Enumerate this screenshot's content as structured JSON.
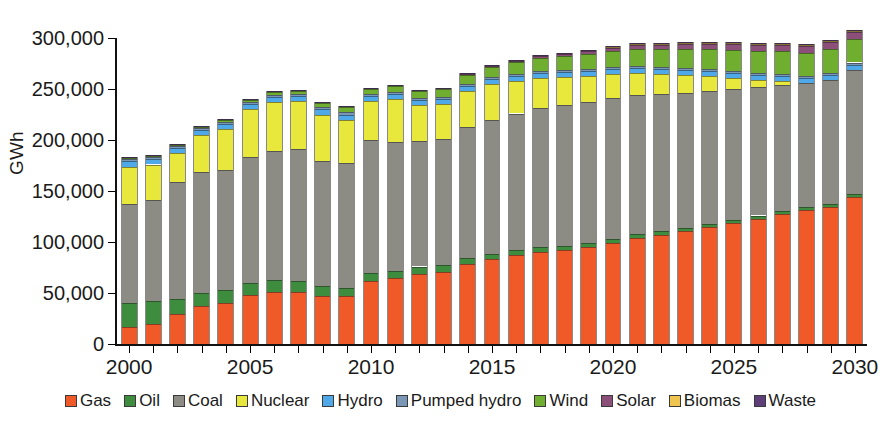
{
  "chart_data": {
    "type": "bar",
    "stacked": true,
    "title": "",
    "subtitle": "",
    "xlabel": "",
    "ylabel": "GWh",
    "ylim": [
      0,
      300000
    ],
    "ytick_values": [
      0,
      50000,
      100000,
      150000,
      200000,
      250000,
      300000
    ],
    "ytick_labels": [
      "0",
      "50,000",
      "100,000",
      "150,000",
      "200,000",
      "250,000",
      "300,000"
    ],
    "xtick_labels": [
      "2000",
      "2005",
      "2010",
      "2015",
      "2020",
      "2025",
      "2030"
    ],
    "grid": false,
    "legend_position": "bottom",
    "categories": [
      "2000",
      "2001",
      "2002",
      "2003",
      "2004",
      "2005",
      "2006",
      "2007",
      "2008",
      "2009",
      "2010",
      "2011",
      "2012",
      "2013",
      "2014",
      "2015",
      "2016",
      "2017",
      "2018",
      "2019",
      "2020",
      "2021",
      "2022",
      "2023",
      "2024",
      "2025",
      "2026",
      "2027",
      "2028",
      "2029",
      "2030"
    ],
    "series": [
      {
        "name": "Gas",
        "color": "#F05A28",
        "values": [
          17000,
          20000,
          29000,
          37000,
          40000,
          48000,
          51000,
          51000,
          47000,
          47000,
          62000,
          65000,
          69000,
          71000,
          78000,
          83000,
          87000,
          90000,
          92000,
          95000,
          99000,
          104000,
          107000,
          111000,
          115000,
          119000,
          123000,
          127000,
          131000,
          134000,
          144000
        ]
      },
      {
        "name": "Oil",
        "color": "#3E8C3E",
        "values": [
          23000,
          22000,
          15000,
          13000,
          13000,
          12000,
          12000,
          11000,
          10000,
          8000,
          8000,
          7000,
          7000,
          6000,
          6000,
          5000,
          5000,
          5000,
          4000,
          4000,
          4000,
          4000,
          4000,
          3000,
          3000,
          3000,
          3000,
          3000,
          3000,
          3000,
          3000
        ]
      },
      {
        "name": "Coal",
        "color": "#8C8C84",
        "values": [
          97000,
          99000,
          115000,
          119000,
          118000,
          123000,
          126000,
          129000,
          122000,
          122000,
          130000,
          126000,
          123000,
          124000,
          129000,
          132000,
          134000,
          136000,
          138000,
          138000,
          138000,
          136000,
          134000,
          132000,
          130000,
          128000,
          126000,
          124000,
          122000,
          122000,
          122000
        ]
      },
      {
        "name": "Nuclear",
        "color": "#E8E83C",
        "values": [
          37000,
          35000,
          28000,
          36000,
          40000,
          47000,
          48000,
          47000,
          46000,
          43000,
          38000,
          42000,
          35000,
          34000,
          35000,
          35000,
          32000,
          30000,
          28000,
          26000,
          24000,
          22000,
          20000,
          18000,
          15000,
          11000,
          7000,
          4000,
          0,
          0,
          0
        ]
      },
      {
        "name": "Hydro",
        "color": "#4FA8E8",
        "values": [
          5000,
          5000,
          5000,
          5000,
          5000,
          5000,
          5000,
          5000,
          5000,
          5000,
          5000,
          5000,
          5000,
          5000,
          5000,
          5000,
          5000,
          5000,
          5000,
          5000,
          5000,
          5000,
          5000,
          5000,
          5000,
          5000,
          5000,
          5000,
          5000,
          5000,
          5000
        ]
      },
      {
        "name": "Pumped hydro",
        "color": "#7A97B5",
        "values": [
          2000,
          2000,
          2000,
          2000,
          2000,
          2000,
          2000,
          2000,
          2000,
          2000,
          2000,
          2000,
          2000,
          2000,
          2000,
          2000,
          2000,
          2000,
          2000,
          2000,
          2000,
          2000,
          2000,
          2000,
          2000,
          2000,
          2000,
          2000,
          2000,
          2000,
          2000
        ]
      },
      {
        "name": "Wind",
        "color": "#6FAE2E",
        "values": [
          1000,
          1000,
          1000,
          1000,
          2000,
          2000,
          3000,
          3000,
          4000,
          5000,
          5000,
          6000,
          7000,
          8000,
          9000,
          10000,
          11000,
          12000,
          13000,
          14000,
          15000,
          16000,
          17000,
          18000,
          19000,
          20000,
          21000,
          22000,
          22000,
          23000,
          23000
        ]
      },
      {
        "name": "Solar",
        "color": "#8C4F7A",
        "values": [
          0,
          0,
          0,
          0,
          0,
          0,
          0,
          0,
          0,
          0,
          0,
          0,
          0,
          0,
          1000,
          1000,
          1000,
          2000,
          2000,
          3000,
          3000,
          4000,
          4000,
          5000,
          5000,
          6000,
          6000,
          6000,
          7000,
          7000,
          7000
        ]
      },
      {
        "name": "Biomas",
        "color": "#EFC550",
        "values": [
          0,
          0,
          0,
          0,
          0,
          0,
          0,
          0,
          0,
          0,
          0,
          0,
          0,
          0,
          0,
          0,
          0,
          0,
          0,
          0,
          1000,
          1000,
          1000,
          1000,
          1000,
          1000,
          1000,
          1000,
          1000,
          1000,
          1000
        ]
      },
      {
        "name": "Waste",
        "color": "#5E3F7A",
        "values": [
          1000,
          1000,
          1000,
          1000,
          1000,
          1000,
          1000,
          1000,
          1000,
          1000,
          1000,
          1000,
          1000,
          1000,
          1000,
          1000,
          1000,
          1000,
          1000,
          1000,
          1000,
          1000,
          1000,
          1000,
          1000,
          1000,
          1000,
          1000,
          1000,
          1000,
          1000
        ]
      }
    ]
  },
  "legend": {
    "items": [
      {
        "label": "Gas"
      },
      {
        "label": "Oil"
      },
      {
        "label": "Coal"
      },
      {
        "label": "Nuclear"
      },
      {
        "label": "Hydro"
      },
      {
        "label": "Pumped hydro"
      },
      {
        "label": "Wind"
      },
      {
        "label": "Solar"
      },
      {
        "label": "Biomas"
      },
      {
        "label": "Waste"
      }
    ]
  }
}
